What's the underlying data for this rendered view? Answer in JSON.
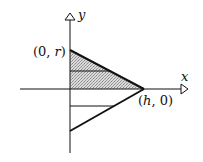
{
  "diagram": {
    "type": "cone-of-revolution-cross-section",
    "axes": {
      "x_label": "x",
      "y_label": "y"
    },
    "points": {
      "top_vertex_label": "(0, r)",
      "right_vertex_label": "(h, 0)"
    },
    "labels": {
      "top_vertex_open": "(0, ",
      "top_vertex_var": "r",
      "top_vertex_close": ")",
      "right_vertex_open": "(",
      "right_vertex_var": "h",
      "right_vertex_close": ", 0)"
    },
    "colors": {
      "stroke": "#111111",
      "shade": "#c8c8c8",
      "background": "#ffffff"
    }
  }
}
